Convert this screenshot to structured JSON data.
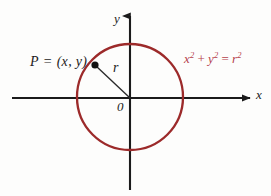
{
  "figure": {
    "background_color": "#fdfdfc",
    "axis_color": "#1b1b1b",
    "circle_color": "#9c2a2a",
    "equation_color": "#b5404a",
    "point_color": "#121212"
  },
  "labels": {
    "point_p": "P = (x, y)",
    "point_p_name": "P",
    "point_p_equals": " = ",
    "point_p_coords": "(x, y)",
    "radius": "r",
    "origin": "0",
    "axis_x": "x",
    "axis_y": "y"
  },
  "equation": {
    "x_base": "x",
    "x_exp": "2",
    "plus": "+",
    "y_base": "y",
    "y_exp": "2",
    "equals": "=",
    "r_base": "r",
    "r_exp": "2",
    "full_text": "x² + y² = r²"
  },
  "geometry": {
    "origin_x": 130,
    "origin_y": 98,
    "radius_px": 53,
    "point_p_x": 95,
    "point_p_y": 65,
    "x_axis_start_x": 12,
    "x_axis_end_x": 252,
    "y_axis_top_y": 14,
    "y_axis_bottom_y": 190
  }
}
